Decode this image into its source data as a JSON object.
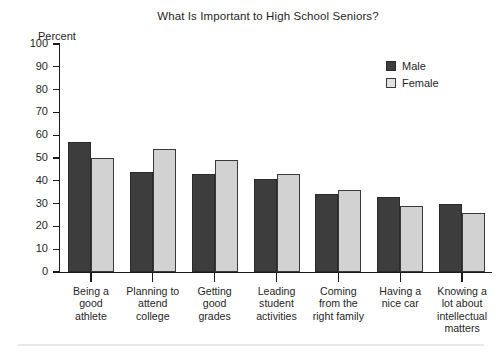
{
  "chart_data": {
    "type": "bar",
    "title": "What Is Important to High School Seniors?",
    "xlabel": "",
    "ylabel": "Percent",
    "ylim": [
      0,
      100
    ],
    "ytick_labels": [
      "100",
      "90",
      "80",
      "70",
      "60",
      "50",
      "40",
      "30",
      "20",
      "10",
      "0"
    ],
    "ytick_values": [
      100,
      90,
      80,
      70,
      60,
      50,
      40,
      30,
      20,
      10,
      0
    ],
    "grid": false,
    "legend_position": "top-right",
    "categories": [
      "Being a good athlete",
      "Planning to attend college",
      "Getting good grades",
      "Leading student activities",
      "Coming from the right family",
      "Having a nice car",
      "Knowing a lot about intellectual matters"
    ],
    "category_label_lines": [
      [
        "Being a",
        "good",
        "athlete"
      ],
      [
        "Planning to",
        "attend",
        "college"
      ],
      [
        "Getting",
        "good",
        "grades"
      ],
      [
        "Leading",
        "student",
        "activities"
      ],
      [
        "Coming",
        "from the",
        "right family"
      ],
      [
        "Having a",
        "nice car"
      ],
      [
        "Knowing a",
        "lot about",
        "intellectual",
        "matters"
      ]
    ],
    "series": [
      {
        "name": "Male",
        "color": "#3d3d3d",
        "values": [
          57,
          44,
          43,
          41,
          34,
          33,
          30
        ]
      },
      {
        "name": "Female",
        "color": "#d2d2d2",
        "values": [
          50,
          54,
          49,
          43,
          36,
          29,
          26
        ]
      }
    ]
  },
  "legend": {
    "items": [
      {
        "label": "Male"
      },
      {
        "label": "Female"
      }
    ]
  }
}
